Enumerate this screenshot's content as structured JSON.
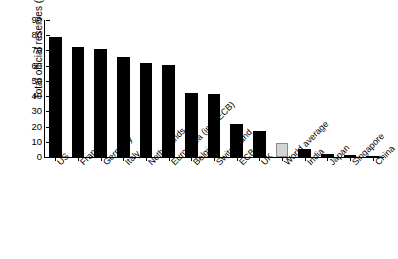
{
  "chart_data": {
    "type": "bar",
    "title": "",
    "xlabel": "",
    "ylabel": "Total official reserves (%)",
    "ylim": [
      0,
      90
    ],
    "yticks": [
      0,
      10,
      20,
      30,
      40,
      50,
      60,
      70,
      80,
      90
    ],
    "grid": false,
    "legend": "none",
    "categories": [
      "US",
      "France",
      "Germany",
      "Italy",
      "Netherlands",
      "Euro Area (incl. ECB)",
      "Belgium",
      "Switzerland",
      "ECB",
      "UK",
      "World average",
      "India",
      "Japan",
      "Singapore",
      "China"
    ],
    "values": [
      79,
      72,
      71,
      66,
      61.5,
      60.5,
      42,
      41.5,
      22,
      17,
      9,
      5,
      2,
      1.5,
      0.8
    ],
    "highlight_category": "World average",
    "highlight_index": 10,
    "bar_color": "#000000",
    "highlight_color": "#d4d4d4",
    "highlight_edge_color": "#8a8a8a",
    "axis_color": "#000000",
    "background_color": "#ffffff"
  }
}
